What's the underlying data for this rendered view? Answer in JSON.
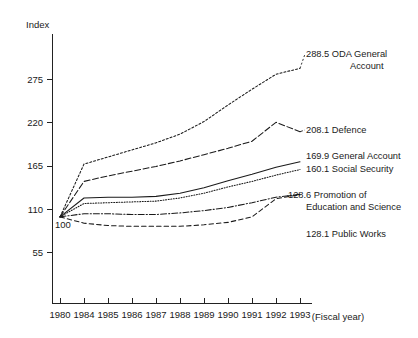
{
  "chart_data": {
    "type": "line",
    "title": "",
    "ylabel": "Index",
    "xlabel": "(Fiscal year)",
    "grid": false,
    "legend_position": "right-inline-end-labels",
    "base_note": "100",
    "x": [
      "1980",
      "1984",
      "1985",
      "1986",
      "1987",
      "1988",
      "1989",
      "1990",
      "1991",
      "1992",
      "1993"
    ],
    "categories": [
      "1980",
      "1984",
      "1985",
      "1986",
      "1987",
      "1988",
      "1989",
      "1990",
      "1991",
      "1992",
      "1993"
    ],
    "yticks": [
      55,
      110,
      165,
      220,
      275
    ],
    "ylim": [
      0,
      300
    ],
    "xlim": [
      1980,
      1993
    ],
    "series": [
      {
        "name": "ODA General Account",
        "end_value": "288.5",
        "label": "288.5 ODA General",
        "label_line2": "Account",
        "style": "dotted",
        "values": [
          100,
          167,
          176,
          185,
          194,
          205,
          221,
          242,
          262,
          281,
          288.5
        ]
      },
      {
        "name": "Defence",
        "end_value": "208.1",
        "label": "208.1 Defence",
        "label_line2": "",
        "style": "dashed",
        "values": [
          100,
          145,
          152,
          158,
          164,
          171,
          179,
          187,
          196,
          220,
          208.1
        ]
      },
      {
        "name": "General Account",
        "end_value": "169.9",
        "label": "169.9 General Account",
        "label_line2": "",
        "style": "solid",
        "values": [
          100,
          124,
          125,
          125,
          126,
          130,
          137,
          146,
          154,
          163,
          169.9
        ]
      },
      {
        "name": "Social Security",
        "end_value": "160.1",
        "label": "160.1 Social Security",
        "label_line2": "",
        "style": "fine-dotted",
        "values": [
          100,
          117,
          118,
          119,
          120,
          124,
          130,
          138,
          145,
          153,
          160.1
        ]
      },
      {
        "name": "Promotion of Education and Science",
        "end_value": "128.6",
        "label": "128.6 Promotion of",
        "label_line2": "Education and Science",
        "style": "dash-dot",
        "values": [
          100,
          104,
          104,
          103,
          103,
          105,
          108,
          112,
          118,
          125,
          128.6
        ]
      },
      {
        "name": "Public Works",
        "end_value": "128.1",
        "label": "128.1 Public Works",
        "label_line2": "",
        "style": "long-dash",
        "values": [
          100,
          92,
          89,
          88,
          88,
          88,
          90,
          93,
          100,
          123,
          128.1
        ]
      }
    ]
  }
}
